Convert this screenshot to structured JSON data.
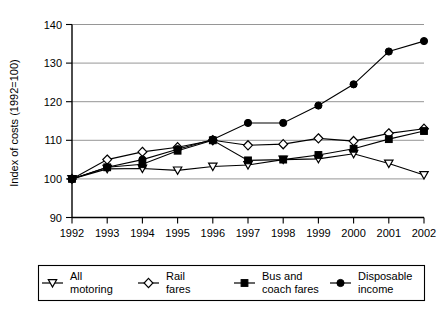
{
  "chart_data": {
    "type": "line",
    "title": "",
    "xlabel": "",
    "ylabel": "Index of costs (1992=100)",
    "x": [
      1992,
      1993,
      1994,
      1995,
      1996,
      1997,
      1998,
      1999,
      2000,
      2001,
      2002
    ],
    "categories": [
      "1992",
      "1993",
      "1994",
      "1995",
      "1996",
      "1997",
      "1998",
      "1999",
      "2000",
      "2001",
      "2002"
    ],
    "xlim": [
      1992,
      2002
    ],
    "ylim": [
      90,
      140
    ],
    "yticks": [
      90,
      100,
      110,
      120,
      130,
      140
    ],
    "ytick_labels": [
      "90",
      "100",
      "110",
      "120",
      "130",
      "140"
    ],
    "grid": "horizontal",
    "legend_position": "bottom",
    "series": [
      {
        "name": "All motoring",
        "marker": "triangle-down-open",
        "values": [
          100,
          102.6,
          102.7,
          102.2,
          103.2,
          103.6,
          105,
          105.2,
          106.5,
          104,
          101
        ]
      },
      {
        "name": "Rail fares",
        "marker": "diamond-open",
        "values": [
          100,
          105,
          107,
          108.2,
          110,
          108.7,
          109,
          110.5,
          109.8,
          111.8,
          113
        ]
      },
      {
        "name": "Bus and coach fares",
        "marker": "square-filled",
        "values": [
          100,
          103,
          103.8,
          107.3,
          110,
          104.8,
          105,
          106.2,
          107.8,
          110.3,
          112.4
        ]
      },
      {
        "name": "Disposable income",
        "marker": "circle-filled",
        "values": [
          100,
          103,
          105,
          107.7,
          110.2,
          114.5,
          114.5,
          119,
          124.5,
          133,
          135.7
        ]
      }
    ]
  },
  "legend": {
    "items": [
      {
        "label_line1": "All",
        "label_line2": "motoring",
        "marker": "triangle-down-open"
      },
      {
        "label_line1": "Rail",
        "label_line2": "fares",
        "marker": "diamond-open"
      },
      {
        "label_line1": "Bus and",
        "label_line2": "coach fares",
        "marker": "square-filled"
      },
      {
        "label_line1": "Disposable",
        "label_line2": "income",
        "marker": "circle-filled"
      }
    ]
  },
  "colors": {
    "ink": "#000000",
    "grid": "#8a8a8a",
    "background": "#ffffff"
  }
}
